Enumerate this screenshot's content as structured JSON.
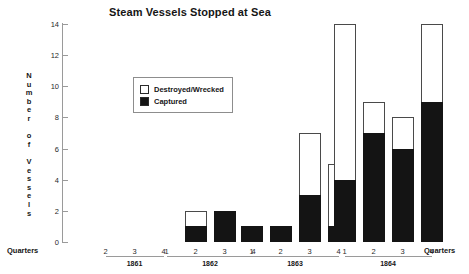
{
  "chart_data": {
    "type": "bar",
    "subtype": "stacked",
    "title": "Steam Vessels Stopped at Sea",
    "xlabel": "Quarters",
    "ylabel": "Number of Vessels",
    "ylim": [
      0,
      14
    ],
    "ytick_labels": [
      "0",
      "2",
      "4",
      "6",
      "8",
      "10",
      "12",
      "14"
    ],
    "ytick_values": [
      0,
      2,
      4,
      6,
      8,
      10,
      12,
      14
    ],
    "grid": false,
    "legend_position": "upper-left-inside",
    "legend": [
      {
        "name": "Destroyed/Wrecked",
        "color": "#ffffff",
        "edge": "#4a4a4a"
      },
      {
        "name": "Captured",
        "color": "#141414",
        "edge": "#141414"
      }
    ],
    "categories": [
      "1861 Q1",
      "1861 Q2",
      "1861 Q3",
      "1861 Q4",
      "1862 Q1",
      "1862 Q2",
      "1862 Q3",
      "1862 Q4",
      "1863 Q1",
      "1863 Q2",
      "1863 Q3",
      "1863 Q4",
      "1864 Q1",
      "1864 Q2",
      "1864 Q3",
      "1864 Q4"
    ],
    "series": [
      {
        "name": "Captured",
        "values": [
          0,
          0,
          0,
          0,
          0,
          1,
          2,
          0,
          1,
          1,
          3,
          1,
          4,
          7,
          6,
          9
        ]
      },
      {
        "name": "Destroyed/Wrecked",
        "values": [
          0,
          0,
          0,
          0,
          0,
          1,
          0,
          0,
          0,
          0,
          4,
          4,
          10,
          2,
          2,
          5
        ]
      }
    ],
    "totals": [
      0,
      0,
      0,
      0,
      0,
      2,
      2,
      0,
      1,
      1,
      7,
      5,
      14,
      9,
      8,
      14
    ],
    "groups": [
      {
        "year": "1861",
        "quarters": [
          "1",
          "2",
          "3",
          "4"
        ],
        "bars": [
          {
            "quarter": "1",
            "captured": 0,
            "destroyed": 0,
            "total": 0
          },
          {
            "quarter": "2",
            "captured": 0,
            "destroyed": 0,
            "total": 0
          },
          {
            "quarter": "3",
            "captured": 0,
            "destroyed": 0,
            "total": 0
          },
          {
            "quarter": "4",
            "captured": 0,
            "destroyed": 0,
            "total": 0
          }
        ]
      },
      {
        "year": "1862",
        "quarters": [
          "1",
          "2",
          "3",
          "4"
        ],
        "bars": [
          {
            "quarter": "1",
            "captured": 0,
            "destroyed": 0,
            "total": 0
          },
          {
            "quarter": "2",
            "captured": 1,
            "destroyed": 1,
            "total": 2
          },
          {
            "quarter": "3",
            "captured": 2,
            "destroyed": 0,
            "total": 2
          },
          {
            "quarter": "4",
            "captured": 0,
            "destroyed": 0,
            "total": 0
          }
        ]
      },
      {
        "year": "1863",
        "quarters": [
          "1",
          "2",
          "3",
          "4"
        ],
        "bars": [
          {
            "quarter": "1",
            "captured": 1,
            "destroyed": 0,
            "total": 1
          },
          {
            "quarter": "2",
            "captured": 1,
            "destroyed": 0,
            "total": 1
          },
          {
            "quarter": "3",
            "captured": 3,
            "destroyed": 4,
            "total": 7
          },
          {
            "quarter": "4",
            "captured": 1,
            "destroyed": 4,
            "total": 5
          }
        ]
      },
      {
        "year": "1864",
        "quarters": [
          "1",
          "2",
          "3",
          "4"
        ],
        "bars": [
          {
            "quarter": "1",
            "captured": 4,
            "destroyed": 10,
            "total": 14
          },
          {
            "quarter": "2",
            "captured": 7,
            "destroyed": 2,
            "total": 9
          },
          {
            "quarter": "3",
            "captured": 6,
            "destroyed": 2,
            "total": 8
          },
          {
            "quarter": "4",
            "captured": 9,
            "destroyed": 5,
            "total": 14
          }
        ]
      }
    ]
  },
  "axis_caption_left": "Quarters",
  "axis_caption_right": "Quarters",
  "y_axis_title_stacked": "N\nu\nm\nb\ne\nr\n\no\nf\n\nV\ne\ns\ns\ne\nl\ns"
}
